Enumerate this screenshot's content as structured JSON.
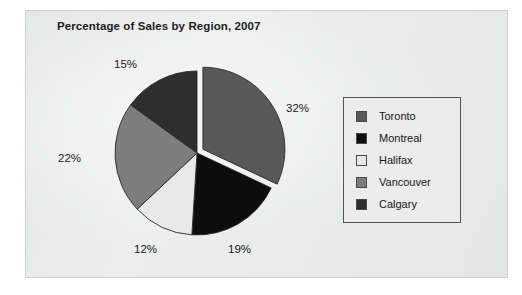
{
  "chart_data": {
    "type": "pie",
    "title": "Percentage of Sales by Region, 2007",
    "xlabel": "",
    "ylabel": "",
    "legend_position": "right",
    "grid": false,
    "exploded_slice": "Toronto",
    "categories": [
      "Toronto",
      "Montreal",
      "Halifax",
      "Vancouver",
      "Calgary"
    ],
    "values": [
      32,
      19,
      12,
      22,
      15
    ],
    "value_labels": [
      "32%",
      "19%",
      "12%",
      "22%",
      "15%"
    ],
    "colors": [
      "#585858",
      "#0d0d0d",
      "#e8e8e8",
      "#7d7d7d",
      "#2e2e2e"
    ],
    "slices": [
      {
        "label": "Toronto",
        "value": 32,
        "value_label": "32%",
        "color": "#585858"
      },
      {
        "label": "Montreal",
        "value": 19,
        "value_label": "19%",
        "color": "#0d0d0d"
      },
      {
        "label": "Halifax",
        "value": 12,
        "value_label": "12%",
        "color": "#e8e8e8"
      },
      {
        "label": "Vancouver",
        "value": 22,
        "value_label": "22%",
        "color": "#7d7d7d"
      },
      {
        "label": "Calgary",
        "value": 15,
        "value_label": "15%",
        "color": "#2e2e2e"
      }
    ]
  },
  "legend": {
    "items": [
      {
        "label": "Toronto",
        "color": "#585858"
      },
      {
        "label": "Montreal",
        "color": "#0d0d0d"
      },
      {
        "label": "Halifax",
        "color": "#e8e8e8"
      },
      {
        "label": "Vancouver",
        "color": "#7d7d7d"
      },
      {
        "label": "Calgary",
        "color": "#2e2e2e"
      }
    ]
  }
}
